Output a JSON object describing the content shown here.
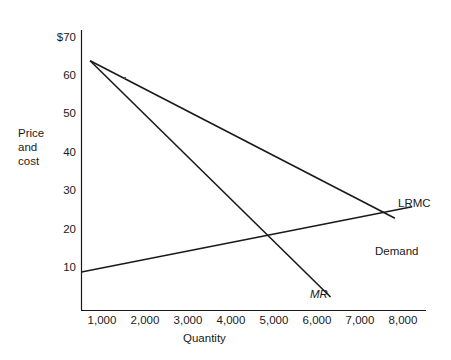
{
  "chart_data": {
    "type": "line",
    "title": "",
    "xlabel": "Quantity",
    "ylabel": "Price and cost",
    "ylabel_lines": [
      "Price",
      "and",
      "cost"
    ],
    "xlim": [
      0,
      8000
    ],
    "ylim": [
      0,
      70
    ],
    "grid": false,
    "legend": "inline-right",
    "xticks": [
      1000,
      2000,
      3000,
      4000,
      5000,
      6000,
      7000,
      8000
    ],
    "xtick_labels": [
      "1,000",
      "2,000",
      "3,000",
      "4,000",
      "5,000",
      "6,000",
      "7,000",
      "8,000"
    ],
    "yticks": [
      10,
      20,
      30,
      40,
      50,
      60,
      70
    ],
    "ytick_labels": [
      "10",
      "20",
      "30",
      "40",
      "50",
      "60",
      "$70"
    ],
    "series": [
      {
        "name": "Demand",
        "label": "Demand",
        "label_italic": false,
        "x": [
          200,
          7300
        ],
        "y": [
          65,
          24
        ],
        "color": "#1a1a1a"
      },
      {
        "name": "MR",
        "label": "MR",
        "label_italic": true,
        "x": [
          200,
          5800
        ],
        "y": [
          65,
          3.5
        ],
        "color": "#1a1a1a"
      },
      {
        "name": "LRMC",
        "label": "LRMC",
        "label_italic": false,
        "x": [
          0,
          7700
        ],
        "y": [
          10,
          27
        ],
        "color": "#1a1a1a"
      }
    ],
    "annotations": [
      {
        "name": "mr-lrmc-intersection",
        "x": 4400,
        "y": 19
      },
      {
        "name": "demand-lrmc-intersection",
        "x": 6700,
        "y": 25
      }
    ]
  },
  "labels": {
    "y_axis_title_l1": "Price",
    "y_axis_title_l2": "and",
    "y_axis_title_l3": "cost",
    "x_axis_title": "Quantity",
    "demand": "Demand",
    "mr": "MR",
    "lrmc": "LRMC",
    "y70": "$70",
    "y60": "60",
    "y50": "50",
    "y40": "40",
    "y30": "30",
    "y20": "20",
    "y10": "10",
    "x1000": "1,000",
    "x2000": "2,000",
    "x3000": "3,000",
    "x4000": "4,000",
    "x5000": "5,000",
    "x6000": "6,000",
    "x7000": "7,000",
    "x8000": "8,000"
  },
  "colors": {
    "line": "#1a1a1a",
    "axis": "#1a1a1a",
    "text": "#1a1a1a",
    "background": "#ffffff"
  }
}
